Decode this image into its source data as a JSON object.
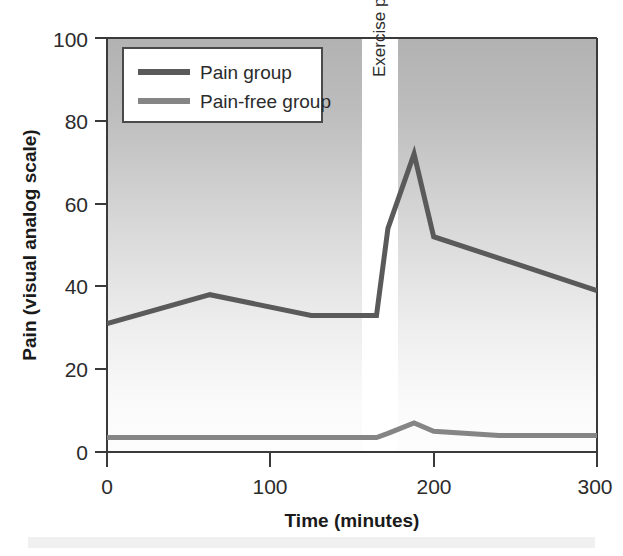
{
  "chart_data": {
    "type": "line",
    "title": "",
    "xlabel": "Time (minutes)",
    "ylabel": "Pain (visual analog scale)",
    "xlim": [
      0,
      300
    ],
    "ylim": [
      0,
      100
    ],
    "xticks": [
      0,
      100,
      200,
      300
    ],
    "yticks": [
      0,
      20,
      40,
      60,
      80,
      100
    ],
    "xtick_labels": [
      "0",
      "100",
      "200",
      "300"
    ],
    "ytick_labels": [
      "0",
      "20",
      "40",
      "60",
      "80",
      "100"
    ],
    "grid": false,
    "legend_position": "upper left",
    "series": [
      {
        "name": "Pain group",
        "color": "#5a5a5a",
        "linewidth": 5,
        "x": [
          0,
          63,
          125,
          165,
          172,
          188,
          200,
          300
        ],
        "values": [
          31,
          38,
          33,
          33,
          54,
          72,
          52,
          39
        ]
      },
      {
        "name": "Pain-free group",
        "color": "#858585",
        "linewidth": 5,
        "x": [
          0,
          63,
          125,
          165,
          172,
          188,
          200,
          240,
          300
        ],
        "values": [
          3.5,
          3.5,
          3.5,
          3.5,
          4.5,
          7,
          5,
          4,
          4
        ]
      }
    ],
    "annotations": [
      {
        "text": "Exercise period",
        "type": "vertical-band",
        "x_start": 156,
        "x_end": 178,
        "rotation": -90,
        "band_color": "#ffffff"
      }
    ],
    "background": {
      "type": "vertical-gradient",
      "top_color": "#b4b4b4",
      "bottom_color": "#fbfbfb"
    }
  },
  "legend": {
    "entries": [
      {
        "label": "Pain group",
        "color": "#5a5a5a"
      },
      {
        "label": "Pain-free group",
        "color": "#858585"
      }
    ]
  },
  "axes": {
    "y_title": "Pain (visual analog scale)",
    "x_title": "Time (minutes)",
    "y_tick_0": "0",
    "y_tick_20": "20",
    "y_tick_40": "40",
    "y_tick_60": "60",
    "y_tick_80": "80",
    "y_tick_100": "100",
    "x_tick_0": "0",
    "x_tick_100": "100",
    "x_tick_200": "200",
    "x_tick_300": "300"
  },
  "annotation": {
    "exercise_period": "Exercise period"
  }
}
